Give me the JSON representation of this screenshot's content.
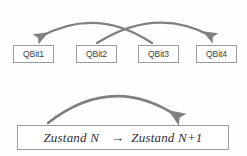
{
  "figure": {
    "background_color": "#fefefe",
    "arrow_color": "#808080",
    "box_border_color": "#9a9a9a",
    "box_fill_color": "#ffffff",
    "text_color": "#3c3c3c"
  },
  "qubits": [
    {
      "label": "QBit1",
      "x": 13,
      "y": 45,
      "width": 41
    },
    {
      "label": "QBit2",
      "x": 76,
      "y": 45,
      "width": 41
    },
    {
      "label": "QBit3",
      "x": 138,
      "y": 45,
      "width": 41
    },
    {
      "label": "QBit4",
      "x": 196,
      "y": 45,
      "width": 41
    }
  ],
  "swap_arrows": [
    {
      "name": "qbit3-to-qbit1",
      "from": "QBit3",
      "to": "QBit1",
      "start": [
        152,
        43
      ],
      "control": [
        96,
        6
      ],
      "end": [
        38,
        38
      ]
    },
    {
      "name": "qbit2-to-qbit4",
      "from": "QBit2",
      "to": "QBit4",
      "start": [
        97,
        43
      ],
      "control": [
        156,
        6
      ],
      "end": [
        213,
        38
      ]
    }
  ],
  "transition_arrow": {
    "name": "state-transition-arrow",
    "start": [
      48,
      122
    ],
    "control": [
      112,
      74
    ],
    "end": [
      179,
      118
    ]
  },
  "state_box": {
    "from_state": "Zustand N",
    "arrow": "→",
    "to_state": "Zustand N+1",
    "full_text": "Zustand N  → Zustand N+1"
  },
  "bleed_through": {
    "lines": [
      "",
      "",
      "",
      "",
      "",
      "",
      "",
      "",
      "",
      ""
    ]
  }
}
